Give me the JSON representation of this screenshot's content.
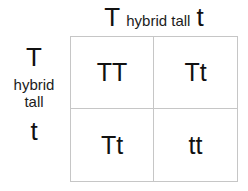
{
  "figure": {
    "type": "punnett-square",
    "grid_line_color": "#c6c6c6",
    "text_color": "#111111",
    "background_color": "#ffffff"
  },
  "top_axis": {
    "allele_left": "T",
    "trait": "hybrid tall",
    "allele_right": "t"
  },
  "left_axis": {
    "allele_top": "T",
    "trait_line_1": "hybrid",
    "trait_line_2": "tall",
    "allele_bottom": "t"
  },
  "cells": [
    {
      "row": 0,
      "col": 0,
      "genotype": "TT"
    },
    {
      "row": 0,
      "col": 1,
      "genotype": "Tt"
    },
    {
      "row": 1,
      "col": 0,
      "genotype": "Tt"
    },
    {
      "row": 1,
      "col": 1,
      "genotype": "tt"
    }
  ],
  "chart_data": {
    "type": "table",
    "title": "",
    "xlabel": "hybrid tall",
    "ylabel": "hybrid tall",
    "columns": [
      "T",
      "t"
    ],
    "rows": [
      "T",
      "t"
    ],
    "values": [
      [
        "TT",
        "Tt"
      ],
      [
        "Tt",
        "tt"
      ]
    ],
    "grid": true,
    "legend": "none"
  }
}
